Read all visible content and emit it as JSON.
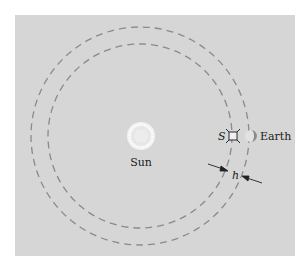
{
  "diagram": {
    "labels": {
      "sun": "Sun",
      "earth": "Earth",
      "satellite": "S",
      "separation": "h"
    },
    "colors": {
      "panel": "#d6d6d6",
      "orbit": "#8a8a8a",
      "sun_fill": "#ececec",
      "sun_glow": "#f8f8f8",
      "earth_shade": "#8c8c8c",
      "text": "#1a1a1a"
    },
    "elements": [
      {
        "id": "sun",
        "type": "circle-glow",
        "label": "Sun"
      },
      {
        "id": "outer-orbit",
        "type": "dashed-circle",
        "note": "Earth orbit"
      },
      {
        "id": "inner-orbit",
        "type": "dashed-circle",
        "note": "satellite orbit"
      },
      {
        "id": "satellite",
        "type": "satellite-icon",
        "label": "S"
      },
      {
        "id": "earth",
        "type": "half-shaded-circle",
        "label": "Earth"
      },
      {
        "id": "distance-marker",
        "type": "arrows",
        "label": "h"
      }
    ]
  }
}
